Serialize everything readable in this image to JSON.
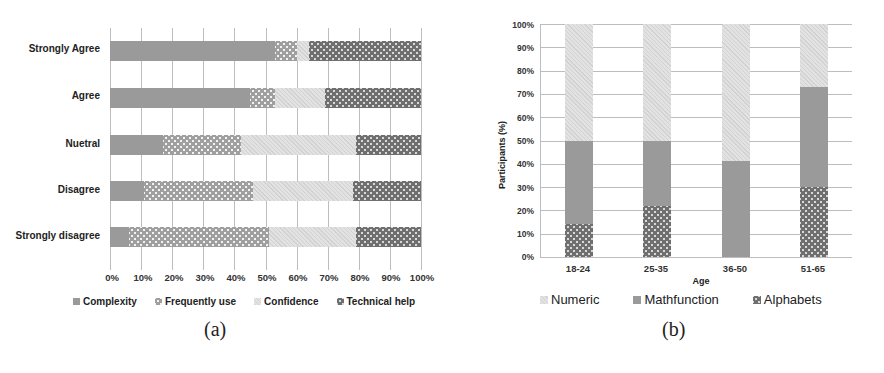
{
  "chart_data": [
    {
      "id": "a",
      "type": "bar",
      "orientation": "horizontal",
      "stacked": "percent",
      "caption": "(a)",
      "categories": [
        "Strongly Agree",
        "Agree",
        "Nuetral",
        "Disagree",
        "Strongly disagree"
      ],
      "series": [
        {
          "name": "Complexity",
          "values": [
            53,
            45,
            17,
            11,
            6
          ]
        },
        {
          "name": "Frequently use",
          "values": [
            7,
            8,
            25,
            35,
            45
          ]
        },
        {
          "name": "Confidence",
          "values": [
            4,
            16,
            37,
            32,
            28
          ]
        },
        {
          "name": "Technical help",
          "values": [
            36,
            31,
            21,
            22,
            21
          ]
        }
      ],
      "xticks": [
        "0%",
        "10%",
        "20%",
        "30%",
        "40%",
        "50%",
        "60%",
        "70%",
        "80%",
        "90%",
        "100%"
      ],
      "xlim": [
        0,
        100
      ],
      "xlabel": "",
      "ylabel": "",
      "grid": "vertical",
      "legend_position": "bottom"
    },
    {
      "id": "b",
      "type": "bar",
      "orientation": "vertical",
      "stacked": "percent",
      "caption": "(b)",
      "categories": [
        "18-24",
        "25-35",
        "36-50",
        "51-65"
      ],
      "series": [
        {
          "name": "Numeric",
          "values": [
            50,
            50,
            59,
            27
          ]
        },
        {
          "name": "Mathfunction",
          "values": [
            36,
            28,
            41,
            43
          ]
        },
        {
          "name": "Alphabets",
          "values": [
            14,
            22,
            0,
            30
          ]
        }
      ],
      "stack_order_bottom_to_top": [
        "Alphabets",
        "Mathfunction",
        "Numeric"
      ],
      "yticks": [
        "0%",
        "10%",
        "20%",
        "30%",
        "40%",
        "50%",
        "60%",
        "70%",
        "80%",
        "90%",
        "100%"
      ],
      "ylim": [
        0,
        100
      ],
      "xlabel": "Age",
      "ylabel": "Participants (%)",
      "grid": "horizontal",
      "legend_position": "bottom"
    }
  ],
  "chart_a": {
    "caption": "(a)",
    "categories": [
      "Strongly Agree",
      "Agree",
      "Nuetral",
      "Disagree",
      "Strongly disagree"
    ],
    "xticks": [
      "0%",
      "10%",
      "20%",
      "30%",
      "40%",
      "50%",
      "60%",
      "70%",
      "80%",
      "90%",
      "100%"
    ],
    "legend": [
      "Complexity",
      "Frequently use",
      "Confidence",
      "Technical help"
    ]
  },
  "chart_b": {
    "caption": "(b)",
    "categories": [
      "18-24",
      "25-35",
      "36-50",
      "51-65"
    ],
    "yticks": [
      "0%",
      "10%",
      "20%",
      "30%",
      "40%",
      "50%",
      "60%",
      "70%",
      "80%",
      "90%",
      "100%"
    ],
    "xlabel": "Age",
    "ylabel": "Participants (%)",
    "legend": [
      "Numeric",
      "Mathfunction",
      "Alphabets"
    ]
  }
}
